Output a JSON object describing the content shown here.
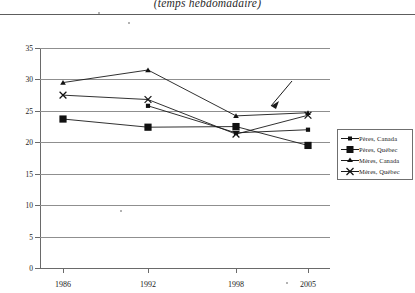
{
  "chart_data": {
    "type": "line",
    "title": "(temps hebdomadaire)",
    "xlabel": "",
    "ylabel": "",
    "categories": [
      "1986",
      "1992",
      "1998",
      "2005"
    ],
    "x_tick_labels": [
      "1986",
      "1992",
      "1998",
      "2005"
    ],
    "y_tick_labels": [
      "0",
      "5",
      "10",
      "15",
      "20",
      "25",
      "30",
      "35"
    ],
    "y_ticks": [
      0,
      5,
      10,
      15,
      20,
      25,
      30,
      35
    ],
    "ylim": [
      0,
      35
    ],
    "grid": "horizontal",
    "legend_position": "right",
    "series": [
      {
        "name": "Pères, Canada",
        "marker": "small-filled-square",
        "values": [
          null,
          25.8,
          21.5,
          22.0
        ]
      },
      {
        "name": "Pères, Québec",
        "marker": "large-filled-square",
        "values": [
          23.7,
          22.4,
          22.5,
          19.5
        ]
      },
      {
        "name": "Mères, Canada",
        "marker": "small-filled-triangle",
        "values": [
          29.5,
          31.5,
          24.2,
          24.7
        ]
      },
      {
        "name": "Mères, Québec",
        "marker": "x-cross",
        "values": [
          27.5,
          26.8,
          21.3,
          24.3
        ]
      }
    ],
    "annotations": [
      {
        "type": "arrow",
        "text": "",
        "points_to": "Mères, Québec 2005"
      }
    ]
  },
  "legend": {
    "items": [
      {
        "label": "Pères, Canada"
      },
      {
        "label": "Pères, Québec"
      },
      {
        "label": "Mères, Canada"
      },
      {
        "label": "Mères, Québec"
      }
    ]
  }
}
